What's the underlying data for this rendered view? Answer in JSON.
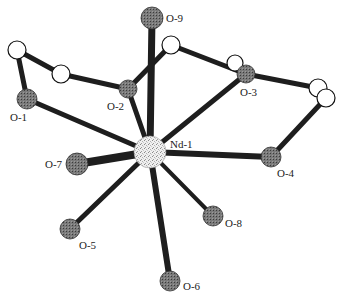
{
  "diagram": {
    "type": "coordination-structure",
    "center": {
      "label": "Nd-1",
      "x": 150,
      "y": 152,
      "r": 16
    },
    "oxygens": [
      {
        "label": "O-1",
        "x": 27,
        "y": 99,
        "lx": 6,
        "ly": 118
      },
      {
        "label": "O-2",
        "x": 128,
        "y": 89,
        "lx": 107,
        "ly": 110
      },
      {
        "label": "O-3",
        "x": 246,
        "y": 74,
        "lx": 240,
        "ly": 96
      },
      {
        "label": "O-4",
        "x": 271,
        "y": 157,
        "lx": 277,
        "ly": 177
      },
      {
        "label": "O-5",
        "x": 70,
        "y": 229,
        "lx": 79,
        "ly": 248
      },
      {
        "label": "O-6",
        "x": 170,
        "y": 281,
        "lx": 183,
        "ly": 290
      },
      {
        "label": "O-7",
        "x": 77,
        "y": 164,
        "lx": 45,
        "ly": 168
      },
      {
        "label": "O-8",
        "x": 213,
        "y": 216,
        "lx": 225,
        "ly": 227
      },
      {
        "label": "O-9",
        "x": 152,
        "y": 18,
        "lx": 166,
        "ly": 22
      }
    ],
    "carbons": [
      {
        "x": 17,
        "y": 50
      },
      {
        "x": 61,
        "y": 74
      },
      {
        "x": 171,
        "y": 45
      },
      {
        "x": 235,
        "y": 63
      },
      {
        "x": 318,
        "y": 88
      },
      {
        "x": 326,
        "y": 98
      }
    ],
    "colors": {
      "bond": "#1e1e1e",
      "oxygen": "#6a6a6a",
      "carbon": "#ffffff",
      "neodymium": "#e6e6e6"
    }
  }
}
